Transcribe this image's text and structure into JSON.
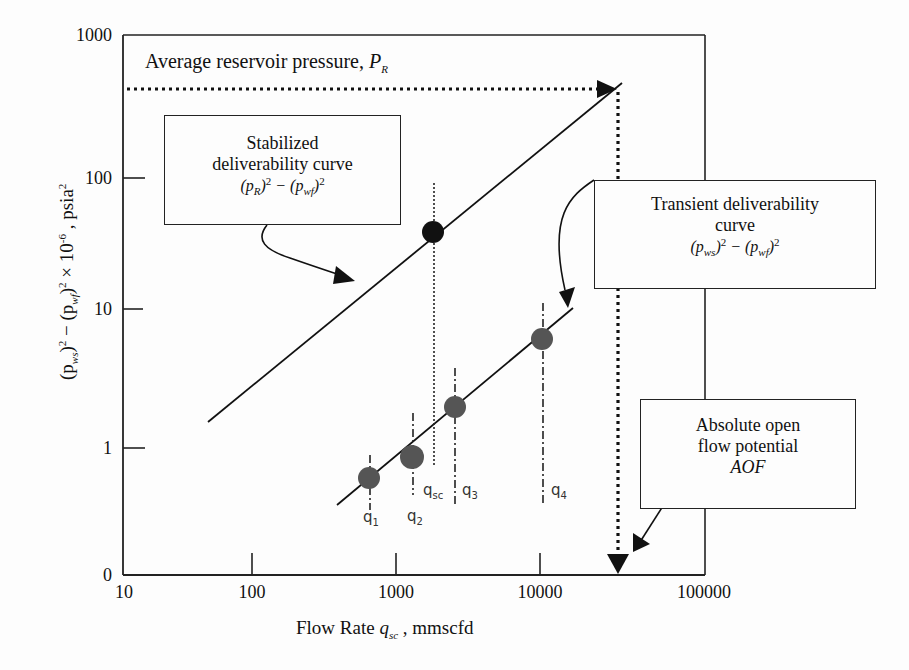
{
  "chart_data": {
    "type": "scatter",
    "title": "",
    "xlabel": "Flow Rate q_sc , mmscfd",
    "ylabel": "(p_ws)^2 - (p_wf)^2 x 10^-6 , psia^2",
    "x_scale": "log",
    "y_scale": "log",
    "xlim": [
      10,
      100000
    ],
    "ylim": [
      0,
      1000
    ],
    "x_ticks": [
      "10",
      "100",
      "1000",
      "10000",
      "100000"
    ],
    "y_ticks": [
      "1000",
      "100",
      "10",
      "1",
      "0"
    ],
    "grid": false,
    "series": [
      {
        "name": "Transient deliverability curve",
        "formula": "(p_ws)^2 - (p_wf)^2",
        "kind": "line+points",
        "points": [
          {
            "label": "q1",
            "x": 650,
            "y": 0.6
          },
          {
            "label": "q2",
            "x": 1300,
            "y": 0.8
          },
          {
            "label": "q3",
            "x": 2400,
            "y": 1.9
          },
          {
            "label": "q4",
            "x": 8500,
            "y": 6
          }
        ],
        "line": {
          "x": [
            400,
            11000
          ],
          "y": [
            0.33,
            10
          ]
        }
      },
      {
        "name": "Stabilized deliverability curve",
        "formula": "(p_R)^2 - (p_wf)^2",
        "kind": "line",
        "line": {
          "x": [
            50,
            27000
          ],
          "y": [
            1.5,
            500
          ]
        },
        "points": [
          {
            "label": "stabilized point at q_sc",
            "x": 1800,
            "y": 38
          }
        ]
      }
    ],
    "reference_lines": [
      {
        "type": "horizontal",
        "label": "Average reservoir pressure, P_R",
        "y": 450,
        "style": "dotted"
      },
      {
        "type": "vertical",
        "label": "AOF",
        "x": 27000,
        "style": "dotted"
      },
      {
        "type": "vertical",
        "label": "q_sc",
        "x": 1800,
        "style": "dotted"
      }
    ],
    "annotations": [
      "Average reservoir pressure, P_R",
      "Stabilized deliverability curve (p_R)^2 - (p_wf)^2",
      "Transient deliverability curve (p_ws)^2 - (p_wf)^2",
      "Absolute open flow potential AOF",
      "q1",
      "q2",
      "qsc",
      "q3",
      "q4"
    ]
  },
  "axes": {
    "y_ticks": [
      {
        "label": "1000",
        "y": 35
      },
      {
        "label": "100",
        "y": 178
      },
      {
        "label": "10",
        "y": 309
      },
      {
        "label": "1",
        "y": 448
      },
      {
        "label": "0",
        "y": 575
      }
    ],
    "x_ticks": [
      {
        "label": "10",
        "x": 123
      },
      {
        "label": "100",
        "x": 252
      },
      {
        "label": "1000",
        "x": 396
      },
      {
        "label": "10000",
        "x": 540
      },
      {
        "label": "100000",
        "x": 705
      }
    ],
    "xlabel_main": "Flow Rate ",
    "xlabel_var": "q",
    "xlabel_sub": "sc",
    "xlabel_units": " , mmscfd",
    "ylabel_a": "(p",
    "ylabel_a_sub": "ws",
    "ylabel_b": ")",
    "ylabel_b_sup": "2",
    "ylabel_c": " − (p",
    "ylabel_c_sub": "wf",
    "ylabel_d": ")",
    "ylabel_d_sup": "2",
    "ylabel_e": " × 10",
    "ylabel_e_sup": "-6",
    "ylabel_f": " , psia",
    "ylabel_f_sup": "2"
  },
  "annotations": {
    "reservoir_text": "Average reservoir pressure, ",
    "reservoir_var": "P",
    "reservoir_sub": "R",
    "stabilized_line1": "Stabilized",
    "stabilized_line2": "deliverability curve",
    "stabilized_formula": "(p_R)^2 − (p_wf)^2",
    "transient_line1": "Transient deliverability",
    "transient_line2": "curve",
    "transient_formula": "(p_ws)^2 − (p_wf)^2",
    "aof_line1": "Absolute open",
    "aof_line2": "flow potential",
    "aof_line3": "AOF"
  },
  "q_labels": [
    {
      "base": "q",
      "sub": "1"
    },
    {
      "base": "q",
      "sub": "2"
    },
    {
      "base": "q",
      "sub": "sc"
    },
    {
      "base": "q",
      "sub": "3"
    },
    {
      "base": "q",
      "sub": "4"
    }
  ],
  "colors": {
    "ink": "#111111",
    "transient_point": "#555555",
    "stabilized_point": "#111111",
    "background": "#fdfdfd"
  }
}
